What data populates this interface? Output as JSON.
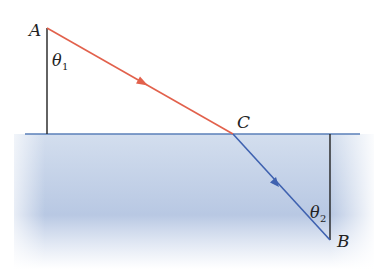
{
  "diagram": {
    "colors": {
      "incident_ray": "#e2614c",
      "refracted_ray": "#3f62b0",
      "surface": "#5a7fb8",
      "normal": "#222222",
      "water_top": "#c9d6ea",
      "water_bottom": "#b5c6e2"
    },
    "points": {
      "A": {
        "label": "A",
        "x": 47,
        "y": 28
      },
      "C": {
        "label": "C",
        "x": 233,
        "y": 134
      },
      "B": {
        "label": "B",
        "x": 330,
        "y": 240
      }
    },
    "angles": {
      "theta1": {
        "symbol": "θ",
        "subscript": "1"
      },
      "theta2": {
        "symbol": "θ",
        "subscript": "2"
      }
    },
    "elements": [
      {
        "type": "incident-ray",
        "from": "A",
        "to": "C"
      },
      {
        "type": "refracted-ray",
        "from": "C",
        "to": "B"
      },
      {
        "type": "normal-line",
        "through": "A"
      },
      {
        "type": "normal-line",
        "through": "B"
      },
      {
        "type": "interface-surface",
        "y": 134
      }
    ]
  }
}
